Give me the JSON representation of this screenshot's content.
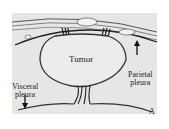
{
  "figure": {
    "panel_label": "A",
    "labels": {
      "tumor": "Tumor",
      "parietal_line1": "Parietal",
      "parietal_line2": "pleura",
      "visceral_line1": "Visceral",
      "visceral_line2": "pleura"
    },
    "colors": {
      "background": "#e6e6e4",
      "stroke": "#333333",
      "tumor_fill": "#ececea"
    }
  }
}
